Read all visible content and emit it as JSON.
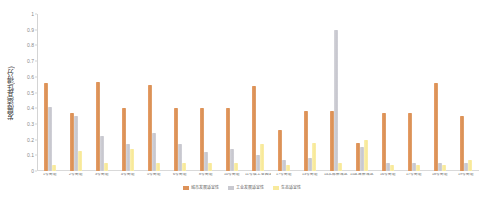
{
  "chart_data": {
    "type": "bar",
    "title": "",
    "xlabel": "",
    "ylabel": "发展适宜性(得分)",
    "ylim": [
      0,
      1
    ],
    "ytick_labels": [
      "1",
      "0.9",
      "0.8",
      "0.7",
      "0.6",
      "0.5",
      "0.4",
      "0.3",
      "0.2",
      "0.1",
      "0"
    ],
    "yticks": [
      1,
      0.9,
      0.8,
      0.7,
      0.6,
      0.5,
      0.4,
      0.3,
      0.2,
      0.1,
      0
    ],
    "grid": false,
    "legend_position": "bottom",
    "categories": [
      "1号街道",
      "2号街道",
      "3号街道",
      "4号街道",
      "5号街道",
      "6号街道",
      "8号街道",
      "10号街道",
      "11号临工业园区",
      "1?号街道",
      "13号街道",
      "14北部新城区",
      "15区域新城区",
      "16号街道",
      "17号街道",
      "18号街道",
      "19号街道"
    ],
    "series": [
      {
        "name": "城市发展适宜性",
        "color": "#dd9259",
        "values": [
          0.56,
          0.37,
          0.57,
          0.4,
          0.55,
          0.4,
          0.4,
          0.4,
          0.54,
          0.26,
          0.38,
          0.38,
          0.18,
          0.37,
          0.37,
          0.56,
          0.35
        ]
      },
      {
        "name": "工业发展适宜性",
        "color": "#c9c9d0",
        "values": [
          0.41,
          0.35,
          0.22,
          0.17,
          0.24,
          0.17,
          0.12,
          0.14,
          0.1,
          0.07,
          0.08,
          0.9,
          0.15,
          0.05,
          0.05,
          0.05,
          0.05
        ]
      },
      {
        "name": "生态适宜性",
        "color": "#f8ea9c",
        "values": [
          0.04,
          0.13,
          0.05,
          0.14,
          0.05,
          0.05,
          0.05,
          0.05,
          0.17,
          0.04,
          0.18,
          0.05,
          0.2,
          0.04,
          0.04,
          0.04,
          0.07
        ]
      }
    ],
    "legend": [
      {
        "label": "城市发展适宜性",
        "color": "#dd9259"
      },
      {
        "label": "工业发展适宜性",
        "color": "#c9c9d0"
      },
      {
        "label": "生态适宜性",
        "color": "#f8ea9c"
      }
    ]
  }
}
